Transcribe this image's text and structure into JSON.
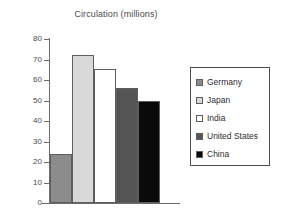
{
  "chart_data": {
    "type": "bar",
    "title": "Circulation (millions)",
    "xlabel": "",
    "ylabel": "",
    "categories": [
      "Germany",
      "Japan",
      "India",
      "United States",
      "China"
    ],
    "values": [
      24,
      72,
      65.5,
      56,
      50
    ],
    "ylim": [
      0,
      80
    ],
    "y_ticks": [
      0,
      10,
      20,
      30,
      40,
      50,
      60,
      70,
      80
    ],
    "y_tick_labels": [
      "0",
      "10",
      "20",
      "30",
      "40",
      "50",
      "60",
      "70",
      "80"
    ],
    "grid": false,
    "legend_position": "right",
    "series": [
      {
        "name": "Germany",
        "value": 24,
        "color": "#8c8c8c"
      },
      {
        "name": "Japan",
        "value": 72,
        "color": "#d9d9d9"
      },
      {
        "name": "India",
        "value": 65.5,
        "color": "#ffffff"
      },
      {
        "name": "United States",
        "value": 56,
        "color": "#545454"
      },
      {
        "name": "China",
        "value": 50,
        "color": "#0a0a0a"
      }
    ]
  },
  "legend": {
    "items": [
      {
        "label": "Germany",
        "color": "#8c8c8c"
      },
      {
        "label": "Japan",
        "color": "#d9d9d9"
      },
      {
        "label": "India",
        "color": "#ffffff"
      },
      {
        "label": "United States",
        "color": "#545454"
      },
      {
        "label": "China",
        "color": "#0a0a0a"
      }
    ]
  },
  "colors": {
    "axis": "#6b6b6b",
    "bar_border": "#5e5e5e",
    "legend_border": "#4d4d4d",
    "text": "#4a4a4a",
    "background": "#ffffff"
  }
}
